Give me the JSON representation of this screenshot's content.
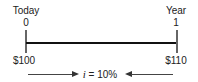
{
  "timeline": {
    "start": {
      "label": "Today",
      "period": "0",
      "amount": "$100"
    },
    "end": {
      "label": "Year",
      "period": "1",
      "amount": "$110"
    },
    "rate": {
      "symbol": "i",
      "text": " = 10%"
    }
  }
}
